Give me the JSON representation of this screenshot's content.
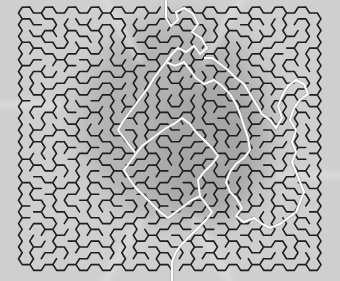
{
  "title": "Hexagonal maze with solution path",
  "colors": {
    "background": "#cfcfcf",
    "shade_dark": "#a9a9a9",
    "shade_mid": "#b8b8b8",
    "wall": "#1e1e1e",
    "solution": "#ffffff",
    "solution_edge": "#9a9a9a"
  },
  "maze": {
    "type": "hexagonal",
    "origin_x": 26,
    "origin_y": 13,
    "cols": 26,
    "rows": 22,
    "hex_w": 11.5,
    "hex_h": 11.7,
    "wall_width": 1.6,
    "seed": 7331,
    "entrance": {
      "x": 166,
      "y": 0
    },
    "exit": {
      "x": 172,
      "y": 281
    }
  },
  "solution_path": [
    [
      166,
      0
    ],
    [
      166,
      18
    ],
    [
      171,
      26
    ],
    [
      178,
      20
    ],
    [
      176,
      12
    ],
    [
      184,
      8
    ],
    [
      193,
      14
    ],
    [
      198,
      24
    ],
    [
      192,
      32
    ],
    [
      201,
      38
    ],
    [
      207,
      48
    ],
    [
      200,
      54
    ],
    [
      194,
      46
    ],
    [
      186,
      52
    ],
    [
      178,
      48
    ],
    [
      172,
      54
    ],
    [
      166,
      62
    ],
    [
      175,
      66
    ],
    [
      184,
      62
    ],
    [
      190,
      70
    ],
    [
      196,
      78
    ],
    [
      204,
      84
    ],
    [
      214,
      80
    ],
    [
      222,
      86
    ],
    [
      230,
      94
    ],
    [
      236,
      104
    ],
    [
      240,
      114
    ],
    [
      244,
      126
    ],
    [
      248,
      138
    ],
    [
      250,
      150
    ],
    [
      244,
      158
    ],
    [
      236,
      164
    ],
    [
      230,
      172
    ],
    [
      226,
      182
    ],
    [
      230,
      192
    ],
    [
      236,
      198
    ],
    [
      242,
      208
    ],
    [
      236,
      216
    ],
    [
      244,
      222
    ],
    [
      254,
      218
    ],
    [
      262,
      224
    ],
    [
      270,
      228
    ],
    [
      280,
      224
    ],
    [
      288,
      218
    ],
    [
      296,
      212
    ],
    [
      300,
      202
    ],
    [
      304,
      192
    ],
    [
      300,
      182
    ],
    [
      296,
      172
    ],
    [
      292,
      162
    ],
    [
      296,
      152
    ],
    [
      292,
      142
    ],
    [
      296,
      130
    ],
    [
      290,
      120
    ],
    [
      294,
      108
    ],
    [
      300,
      100
    ],
    [
      308,
      94
    ],
    [
      304,
      84
    ],
    [
      296,
      80
    ],
    [
      288,
      86
    ],
    [
      282,
      96
    ],
    [
      278,
      106
    ],
    [
      282,
      118
    ],
    [
      276,
      128
    ],
    [
      270,
      120
    ],
    [
      262,
      114
    ],
    [
      256,
      104
    ],
    [
      250,
      94
    ],
    [
      244,
      84
    ],
    [
      236,
      78
    ],
    [
      228,
      70
    ],
    [
      220,
      64
    ],
    [
      212,
      58
    ],
    [
      204,
      58
    ]
  ],
  "solution_path_b": [
    [
      166,
      62
    ],
    [
      160,
      70
    ],
    [
      154,
      78
    ],
    [
      148,
      88
    ],
    [
      142,
      96
    ],
    [
      136,
      104
    ],
    [
      130,
      112
    ],
    [
      124,
      120
    ],
    [
      118,
      130
    ],
    [
      124,
      138
    ],
    [
      130,
      146
    ],
    [
      136,
      154
    ],
    [
      130,
      162
    ],
    [
      124,
      170
    ],
    [
      130,
      180
    ],
    [
      136,
      188
    ],
    [
      144,
      196
    ],
    [
      152,
      204
    ],
    [
      160,
      212
    ],
    [
      168,
      218
    ],
    [
      176,
      212
    ],
    [
      184,
      206
    ],
    [
      192,
      200
    ],
    [
      200,
      196
    ],
    [
      206,
      204
    ],
    [
      212,
      212
    ],
    [
      206,
      220
    ],
    [
      198,
      228
    ],
    [
      190,
      236
    ],
    [
      182,
      244
    ],
    [
      176,
      252
    ],
    [
      172,
      262
    ],
    [
      172,
      281
    ]
  ],
  "solution_path_c": [
    [
      136,
      154
    ],
    [
      142,
      146
    ],
    [
      150,
      140
    ],
    [
      158,
      134
    ],
    [
      166,
      128
    ],
    [
      174,
      124
    ],
    [
      182,
      118
    ],
    [
      190,
      124
    ],
    [
      196,
      132
    ],
    [
      204,
      140
    ],
    [
      212,
      148
    ],
    [
      218,
      156
    ],
    [
      212,
      164
    ],
    [
      204,
      172
    ],
    [
      198,
      180
    ],
    [
      200,
      196
    ]
  ],
  "shade_regions": [
    {
      "cx": 175,
      "cy": 120,
      "rx": 95,
      "ry": 100,
      "color": "#b3b3b3"
    },
    {
      "cx": 210,
      "cy": 150,
      "rx": 55,
      "ry": 70,
      "color": "#a6a6a6"
    }
  ],
  "light_beams": [
    {
      "x1": 105,
      "y1": 0,
      "x2": 140,
      "y2": 60
    },
    {
      "x1": 240,
      "y1": 0,
      "x2": 205,
      "y2": 60
    },
    {
      "x1": 230,
      "y1": 281,
      "x2": 195,
      "y2": 220
    },
    {
      "x1": 105,
      "y1": 281,
      "x2": 140,
      "y2": 220
    },
    {
      "x1": 0,
      "y1": 105,
      "x2": 60,
      "y2": 105
    },
    {
      "x1": 280,
      "y1": 175,
      "x2": 340,
      "y2": 175
    }
  ]
}
